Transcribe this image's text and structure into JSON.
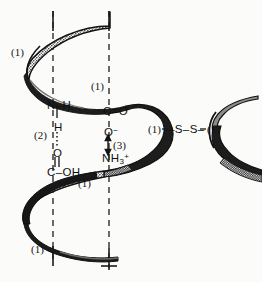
{
  "figure": {
    "background_color": "#fbfbfa",
    "ink_color": "#141414"
  },
  "axis_guides": {
    "name": "helix-axis-dashed-lines",
    "count": 2,
    "style": "dashed"
  },
  "bond_keys": {
    "helix_turn": "(1)",
    "hydrogen_bond": "(2)",
    "ionic_bond": "(3)"
  },
  "helix_turn_labels": [
    {
      "text": "(1)",
      "x": 11,
      "y": 51,
      "note": "upper-left helix turn"
    },
    {
      "text": "(1)",
      "x": 91,
      "y": 85,
      "note": "upper-middle helix turn"
    },
    {
      "text": "(1)",
      "x": 148,
      "y": 128,
      "note": "right helix turn at disulfide"
    },
    {
      "text": "(1)",
      "x": 206,
      "y": 128,
      "note": "second helix at disulfide"
    },
    {
      "text": "(1)",
      "x": 78,
      "y": 182,
      "note": "lower-middle helix turn"
    },
    {
      "text": "(1)",
      "x": 31,
      "y": 248,
      "note": "lower-left helix turn"
    }
  ],
  "chemical_groups": [
    {
      "name": "amide-nh",
      "html": "N–H",
      "x": 47,
      "y": 100
    },
    {
      "name": "amide-h",
      "html": "H",
      "x": 54,
      "y": 126
    },
    {
      "name": "carbonyl-o",
      "html": "O",
      "x": 53,
      "y": 152
    },
    {
      "name": "carboxyl-coh",
      "html": "C–OH",
      "x": 47,
      "y": 172
    },
    {
      "name": "carbonyl-co",
      "html": "C=O",
      "x": 104,
      "y": 110
    },
    {
      "name": "carboxylate-o",
      "html": "O<sup>−</sup>",
      "x": 104,
      "y": 131
    },
    {
      "name": "ammonium-nh3",
      "html": "NH<sub>3</sub><sup>+</sup>",
      "x": 102,
      "y": 157
    },
    {
      "name": "disulfide-bridge",
      "html": "–S–S–",
      "x": 168,
      "y": 128
    }
  ],
  "bond_annotations": [
    {
      "name": "hydrogen-bond-label",
      "text": "(2)",
      "x": 34,
      "y": 133,
      "bond": "hydrogen"
    },
    {
      "name": "ionic-bond-label",
      "text": "(3)",
      "x": 112,
      "y": 143,
      "bond": "ionic"
    }
  ],
  "double_bond_marks": [
    {
      "name": "carbonyl-double-bond-ticks",
      "x": 57,
      "y": 160
    }
  ]
}
